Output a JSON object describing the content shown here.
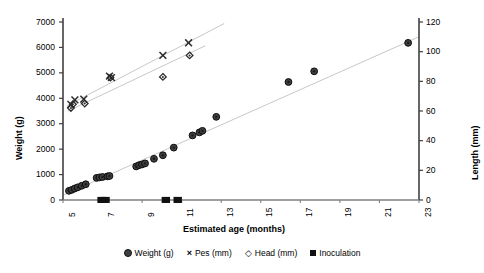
{
  "chart_data": {
    "type": "scatter",
    "title": "",
    "xlabel": "Estimated age (months)",
    "ylabel": "Weight (g)",
    "y2label": "Length (mm)",
    "xlim": [
      5,
      23
    ],
    "ylim": [
      0,
      7000
    ],
    "y2lim": [
      0,
      120
    ],
    "grid": false,
    "legend_position": "bottom",
    "xticks": [
      "5",
      "7",
      "9",
      "11",
      "13",
      "15",
      "17",
      "19",
      "21",
      "23"
    ],
    "yticks_left": [
      "0",
      "1000",
      "2000",
      "3000",
      "4000",
      "5000",
      "6000",
      "7000"
    ],
    "yticks_right": [
      "0",
      "20",
      "40",
      "60",
      "80",
      "100",
      "120"
    ],
    "series": [
      {
        "name": "Weight (g)",
        "marker": "circle",
        "axis": "left",
        "color": "#3f3f3f",
        "trendline": true,
        "points": [
          [
            5.3,
            360
          ],
          [
            5.45,
            400
          ],
          [
            5.6,
            455
          ],
          [
            5.75,
            500
          ],
          [
            5.95,
            560
          ],
          [
            6.15,
            620
          ],
          [
            6.7,
            870
          ],
          [
            6.85,
            890
          ],
          [
            7.0,
            905
          ],
          [
            7.25,
            930
          ],
          [
            7.35,
            945
          ],
          [
            8.7,
            1320
          ],
          [
            8.85,
            1370
          ],
          [
            9.0,
            1400
          ],
          [
            9.15,
            1440
          ],
          [
            9.6,
            1620
          ],
          [
            10.05,
            1760
          ],
          [
            10.6,
            2060
          ],
          [
            11.55,
            2540
          ],
          [
            11.9,
            2660
          ],
          [
            12.05,
            2720
          ],
          [
            12.75,
            3270
          ],
          [
            16.4,
            4640
          ],
          [
            17.7,
            5060
          ],
          [
            22.45,
            6180
          ]
        ]
      },
      {
        "name": "Pes (mm)",
        "marker": "cross",
        "axis": "right",
        "color": "#2b2b2b",
        "trendline": true,
        "points": [
          [
            5.4,
            64.5
          ],
          [
            5.6,
            67.5
          ],
          [
            6.05,
            68.0
          ],
          [
            7.35,
            83.5
          ],
          [
            7.45,
            82.5
          ],
          [
            10.05,
            97.5
          ],
          [
            11.35,
            106.0
          ]
        ]
      },
      {
        "name": "Head (mm)",
        "marker": "diamond",
        "axis": "right",
        "color": "#2b2b2b",
        "trendline": true,
        "points": [
          [
            5.4,
            62.0
          ],
          [
            5.5,
            64.5
          ],
          [
            6.1,
            65.0
          ],
          [
            7.4,
            82.5
          ],
          [
            10.05,
            83.0
          ],
          [
            11.4,
            97.5
          ]
        ]
      },
      {
        "name": "Inoculation",
        "marker": "square",
        "axis": "left",
        "color": "#111111",
        "trendline": false,
        "points": [
          [
            6.95,
            0
          ],
          [
            7.15,
            0
          ],
          [
            10.2,
            0
          ],
          [
            10.8,
            0
          ]
        ]
      }
    ],
    "trendlines": [
      {
        "name": "weight-trend",
        "x0": 5.05,
        "y0": 200,
        "x1": 23.0,
        "y1": 6420,
        "axis": "left",
        "color": "#c8c8c8"
      },
      {
        "name": "pes-trend",
        "x0": 5.2,
        "y0": 63.5,
        "x1": 13.15,
        "y1": 119.0,
        "axis": "right",
        "color": "#c8c8c8"
      },
      {
        "name": "head-trend",
        "x0": 5.25,
        "y0": 60.0,
        "x1": 12.2,
        "y1": 104.0,
        "axis": "right",
        "color": "#c8c8c8"
      }
    ]
  },
  "legend": {
    "items": [
      {
        "label": "Weight (g)",
        "marker": "circle-marker"
      },
      {
        "label": "Pes (mm)",
        "marker": "cross-marker"
      },
      {
        "label": "Head (mm)",
        "marker": "diamond-marker"
      },
      {
        "label": "Inoculation",
        "marker": "square-marker"
      }
    ]
  }
}
